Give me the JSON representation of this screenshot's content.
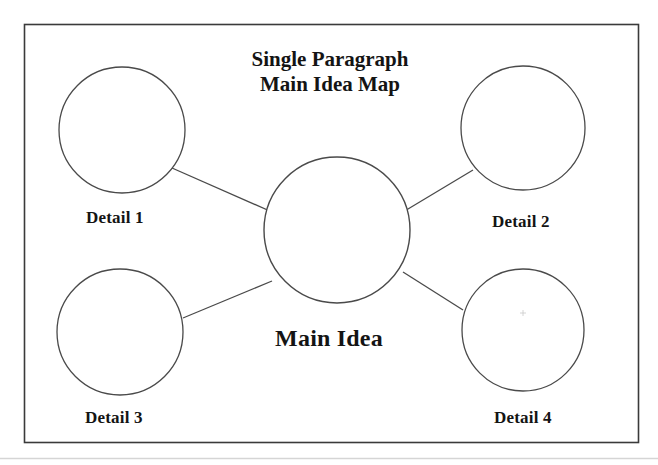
{
  "page": {
    "background_color": "#ffffff",
    "ink_color": "#141414",
    "stroke_color": "#3a3a3a"
  },
  "worksheet": {
    "frame": {
      "name": "worksheet-border",
      "x": 24,
      "y": 24,
      "width": 614,
      "height": 418
    },
    "footer_rule": {
      "name": "footer-separator",
      "y": 458
    },
    "title": {
      "line1": "Single Paragraph",
      "line2": "Main Idea Map"
    },
    "center_node": {
      "label": "Main Idea",
      "cx": 337,
      "cy": 230,
      "r": 73
    },
    "detail_nodes": [
      {
        "label": "Detail 1",
        "cx": 122,
        "cy": 130,
        "r": 63
      },
      {
        "label": "Detail 2",
        "cx": 523,
        "cy": 128,
        "r": 62
      },
      {
        "label": "Detail 3",
        "cx": 120,
        "cy": 332,
        "r": 63
      },
      {
        "label": "Detail 4",
        "cx": 523,
        "cy": 330,
        "r": 61
      }
    ],
    "connectors": [
      {
        "name": "connector-detail-1",
        "x1": 172,
        "y1": 168,
        "x2": 272,
        "y2": 212
      },
      {
        "name": "connector-detail-2",
        "x1": 473,
        "y1": 170,
        "x2": 403,
        "y2": 212
      },
      {
        "name": "connector-detail-3",
        "x1": 183,
        "y1": 318,
        "x2": 272,
        "y2": 281
      },
      {
        "name": "connector-detail-4",
        "x1": 463,
        "y1": 310,
        "x2": 403,
        "y2": 272
      }
    ]
  }
}
